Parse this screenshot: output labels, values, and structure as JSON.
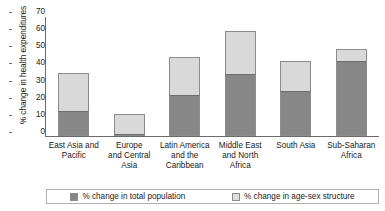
{
  "chart_data": {
    "type": "bar",
    "barmode": "stacked",
    "title": "",
    "xlabel": "",
    "ylabel": "% change in health expenditures",
    "ylim": [
      0,
      70
    ],
    "yticks": [
      0,
      10,
      20,
      30,
      40,
      50,
      60,
      70
    ],
    "grid": false,
    "legend_position": "bottom",
    "categories": [
      "East Asia and Pacific",
      "Europe and Central Asia",
      "Latin America and the Caribbean",
      "Middle East and North Africa",
      "South Asia",
      "Sub-Saharan Africa"
    ],
    "category_label_lines": [
      [
        "East Asia and",
        "Pacific"
      ],
      [
        "Europe",
        "and Central",
        "Asia"
      ],
      [
        "Latin America",
        "and the",
        "Caribbean"
      ],
      [
        "Middle East",
        "and North",
        "Africa"
      ],
      [
        "South Asia"
      ],
      [
        "Sub-Saharan",
        "Africa"
      ]
    ],
    "series": [
      {
        "name": "% change in total population",
        "color": "#878787",
        "values": [
          14.5,
          1,
          24,
          36,
          26,
          44
        ]
      },
      {
        "name": "% change in age-sex structure",
        "color": "#d9d9d9",
        "values": [
          22.5,
          11.5,
          22,
          25,
          18,
          7
        ]
      }
    ],
    "totals": [
      37,
      12.5,
      46,
      61,
      44,
      51
    ]
  },
  "legend": {
    "entries": [
      {
        "label": "% change in total population",
        "swatch": "dark"
      },
      {
        "label": "% change in age-sex structure",
        "swatch": "light"
      }
    ]
  }
}
